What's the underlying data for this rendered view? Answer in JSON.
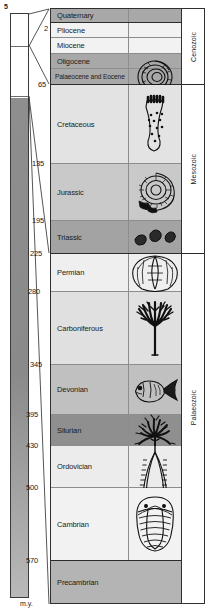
{
  "inset": {
    "top_label": "5",
    "divider_fractions": [
      0.055,
      0.14
    ],
    "fill_start_fraction": 0.143
  },
  "axis": {
    "unit": "m.y.",
    "boundaries": [
      {
        "value": "2",
        "top": 28
      },
      {
        "value": "65",
        "top": 84
      },
      {
        "value": "135",
        "top": 163
      },
      {
        "value": "195",
        "top": 220
      },
      {
        "value": "225",
        "top": 253
      },
      {
        "value": "280",
        "top": 291
      },
      {
        "value": "345",
        "top": 364
      },
      {
        "value": "395",
        "top": 414
      },
      {
        "value": "430",
        "top": 445
      },
      {
        "value": "500",
        "top": 487
      },
      {
        "value": "570",
        "top": 560
      }
    ]
  },
  "chart_data": {
    "type": "table",
    "xlabel": "",
    "ylabel": "m.y.",
    "periods": [
      {
        "name": "Quaternary",
        "top": 0,
        "height": 14,
        "shade": "#a8a8a8",
        "boundary": "thick",
        "fossil": "none",
        "tight": false
      },
      {
        "name": "Pliocene",
        "top": 14,
        "height": 15,
        "shade": "#f2f2f2",
        "boundary": "thin",
        "fossil": "none",
        "tight": false
      },
      {
        "name": "Miocene",
        "top": 29,
        "height": 16,
        "shade": "#f2f2f2",
        "boundary": "thin",
        "fossil": "none",
        "tight": false
      },
      {
        "name": "Oligocene",
        "top": 45,
        "height": 15,
        "shade": "#a8a8a8",
        "boundary": "thin",
        "fossil": "none",
        "tight": false
      },
      {
        "name": "Palaeocene and Eocene",
        "top": 60,
        "height": 16,
        "shade": "#a8a8a8",
        "boundary": "thick",
        "fossil": "foraminifera",
        "tight": true
      },
      {
        "name": "Cretaceous",
        "top": 76,
        "height": 79,
        "shade": "#e3e3e3",
        "boundary": "thin",
        "fossil": "sponge",
        "tight": false
      },
      {
        "name": "Jurassic",
        "top": 155,
        "height": 57,
        "shade": "#c9c9c9",
        "boundary": "thin",
        "fossil": "ammonite",
        "tight": false
      },
      {
        "name": "Triassic",
        "top": 212,
        "height": 33,
        "shade": "#a3a3a3",
        "boundary": "thick",
        "fossil": "fragments",
        "tight": false
      },
      {
        "name": "Permian",
        "top": 245,
        "height": 38,
        "shade": "#efefef",
        "boundary": "thin",
        "fossil": "brachiopod",
        "tight": false
      },
      {
        "name": "Carboniferous",
        "top": 283,
        "height": 73,
        "shade": "#e0e0e0",
        "boundary": "thin",
        "fossil": "plant",
        "tight": false
      },
      {
        "name": "Devonian",
        "top": 356,
        "height": 50,
        "shade": "#c0c0c0",
        "boundary": "thin",
        "fossil": "fish",
        "tight": false
      },
      {
        "name": "Silurian",
        "top": 406,
        "height": 31,
        "shade": "#8f8f8f",
        "boundary": "thin",
        "fossil": "crinoid",
        "tight": false
      },
      {
        "name": "Ordovician",
        "top": 437,
        "height": 42,
        "shade": "#ececec",
        "boundary": "thin",
        "fossil": "graptolite",
        "tight": false
      },
      {
        "name": "Cambrian",
        "top": 479,
        "height": 73,
        "shade": "#f2f2f2",
        "boundary": "thick",
        "fossil": "trilobite",
        "tight": false
      },
      {
        "name": "Precambrian",
        "top": 552,
        "height": 42,
        "shade": "#b4b4b4",
        "boundary": "none",
        "fossil": "none",
        "tight": false
      }
    ],
    "eras": [
      {
        "name": "Cenozoic",
        "top": 0,
        "height": 76,
        "last": false
      },
      {
        "name": "Mesozoic",
        "top": 76,
        "height": 169,
        "last": false
      },
      {
        "name": "Palaeozoic",
        "top": 245,
        "height": 307,
        "last": true
      }
    ]
  }
}
